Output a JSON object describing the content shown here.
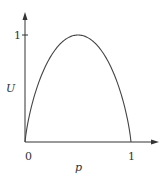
{
  "chart_data": {
    "type": "line",
    "title": "",
    "xlabel": "p",
    "ylabel": "U",
    "xlim": [
      0,
      1
    ],
    "ylim": [
      0,
      1
    ],
    "x_ticks": [
      "0",
      "1"
    ],
    "y_ticks": [
      "1"
    ],
    "grid": false,
    "legend": null,
    "series": [
      {
        "name": "U(p)",
        "x": [
          0,
          0.05,
          0.1,
          0.2,
          0.3,
          0.4,
          0.5,
          0.6,
          0.7,
          0.8,
          0.9,
          0.95,
          1
        ],
        "y": [
          0,
          0.29,
          0.47,
          0.72,
          0.88,
          0.97,
          1.0,
          0.97,
          0.88,
          0.72,
          0.47,
          0.29,
          0
        ]
      }
    ]
  },
  "labels": {
    "x_tick_0": "0",
    "x_tick_1": "1",
    "y_tick_1": "1",
    "xlabel": "p",
    "ylabel": "U"
  },
  "colors": {
    "axis": "#333333",
    "curve": "#444444"
  }
}
